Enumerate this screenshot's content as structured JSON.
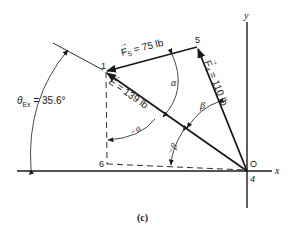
{
  "figure": {
    "caption": "(c)",
    "axes": {
      "x_label": "x",
      "y_label": "y"
    },
    "points": {
      "origin": "O",
      "p4": "4",
      "p1": "1",
      "p5": "5",
      "p6": "6"
    },
    "vectors": [
      {
        "id": "F5",
        "symbol": "F",
        "subscript": "5",
        "label_rest": " = 75 lb",
        "magnitude_lb": 75
      },
      {
        "id": "F4",
        "symbol": "F",
        "subscript": "4",
        "label_rest": " = 110 lb",
        "magnitude_lb": 110
      },
      {
        "id": "E",
        "symbol": "E",
        "subscript": "",
        "label_rest": " = 139 lb",
        "magnitude_lb": 139
      }
    ],
    "angles": {
      "alpha": "α",
      "beta": "β",
      "minus_beta": "−β",
      "theta_symbol": "θ",
      "theta_subscript": "Ex",
      "theta_value": " = 35.6°"
    },
    "colors": {
      "ink": "#1a1a1a",
      "background": "#ffffff"
    }
  }
}
